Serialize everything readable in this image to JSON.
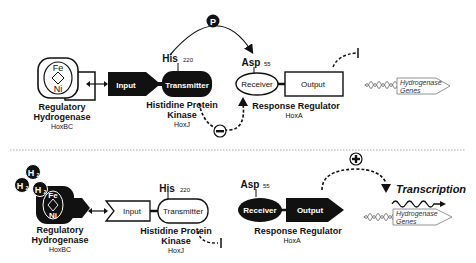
{
  "top_panel": {
    "hydrogenase": {
      "name_line1": "Regulatory",
      "name_line2": "Hydrogenase",
      "gene": "HoxBC",
      "metal_top": "Fe",
      "metal_bottom": "Ni"
    },
    "kinase": {
      "name_line1": "Histidine Protein",
      "name_line2": "Kinase",
      "gene": "HoxJ",
      "domain_input": "Input",
      "domain_transmitter": "Transmitter",
      "residue": "His",
      "residue_num": "220"
    },
    "regulator": {
      "name": "Response Regulator",
      "gene": "HoxA",
      "domain_receiver": "Receiver",
      "domain_output": "Output",
      "residue": "Asp",
      "residue_num": "55"
    },
    "phospho_symbol": "P",
    "inhibition_symbol": "−",
    "genes": {
      "line1": "Hydrogenase",
      "line2": "Genes"
    }
  },
  "bottom_panel": {
    "h2_label": "H",
    "h2_sub": "2",
    "hydrogenase": {
      "name_line1": "Regulatory",
      "name_line2": "Hydrogenase",
      "gene": "HoxBC",
      "metal_top": "Fe",
      "metal_bottom": "Ni"
    },
    "kinase": {
      "name_line1": "Histidine Protein",
      "name_line2": "Kinase",
      "gene": "HoxJ",
      "domain_input": "Input",
      "domain_transmitter": "Transmitter",
      "residue": "His",
      "residue_num": "220"
    },
    "regulator": {
      "name": "Response Regulator",
      "gene": "HoxA",
      "domain_receiver": "Receiver",
      "domain_output": "Output",
      "residue": "Asp",
      "residue_num": "55"
    },
    "activation_symbol": "+",
    "transcription_label": "Transcription",
    "genes": {
      "line1": "Hydrogenase",
      "line2": "Genes"
    }
  }
}
